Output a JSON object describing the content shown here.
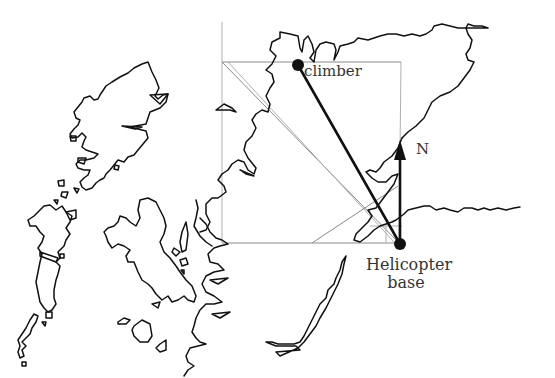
{
  "diagram": {
    "labels": {
      "climber": "climber",
      "north": "N",
      "base_line1": "Helicopter",
      "base_line2": "base"
    },
    "points": {
      "climber": {
        "x": 298,
        "y": 65
      },
      "helicopter_base": {
        "x": 400,
        "y": 244
      }
    },
    "north_arrow": {
      "x": 400,
      "y_start": 244,
      "y_end": 140
    },
    "construction_box": {
      "x1": 222,
      "y1": 62,
      "x2": 401,
      "y2": 243
    },
    "colors": {
      "ink": "#111111",
      "construction": "#8a8a8a",
      "text": "#333333",
      "background": "#ffffff"
    }
  }
}
